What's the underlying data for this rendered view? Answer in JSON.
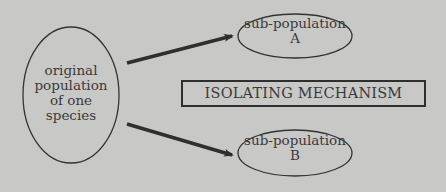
{
  "diagram": {
    "nodes": {
      "original": {
        "lines": [
          "original",
          "population",
          "of one",
          "species"
        ]
      },
      "sub_a": {
        "lines": [
          "sub-population",
          "A"
        ]
      },
      "sub_b": {
        "lines": [
          "sub-population",
          "B"
        ]
      },
      "mechanism": {
        "label": "ISOLATING MECHANISM"
      }
    },
    "edges": [
      {
        "from": "original",
        "to": "sub_a"
      },
      {
        "from": "original",
        "to": "sub_b"
      }
    ],
    "colors": {
      "background": "#c8c8c6",
      "stroke": "#2f2f2f",
      "text": "#3a3a3a"
    }
  }
}
